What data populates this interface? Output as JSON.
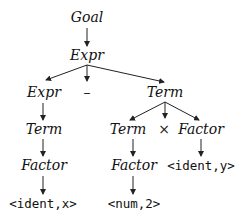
{
  "diagram": {
    "type": "parse-tree",
    "nodes": [
      {
        "id": "goal",
        "label": "Goal",
        "kind": "nonterminal",
        "x": 87,
        "y": 22
      },
      {
        "id": "expr1",
        "label": "Expr",
        "kind": "nonterminal",
        "x": 87,
        "y": 60
      },
      {
        "id": "expr2",
        "label": "Expr",
        "kind": "nonterminal",
        "x": 44,
        "y": 97
      },
      {
        "id": "minus",
        "label": "–",
        "kind": "operator",
        "x": 87,
        "y": 97
      },
      {
        "id": "term1",
        "label": "Term",
        "kind": "nonterminal",
        "x": 165,
        "y": 97
      },
      {
        "id": "term2",
        "label": "Term",
        "kind": "nonterminal",
        "x": 44,
        "y": 134
      },
      {
        "id": "term3",
        "label": "Term",
        "kind": "nonterminal",
        "x": 128,
        "y": 134
      },
      {
        "id": "times",
        "label": "×",
        "kind": "operator",
        "x": 164,
        "y": 134
      },
      {
        "id": "factor1",
        "label": "Factor",
        "kind": "nonterminal",
        "x": 201,
        "y": 134
      },
      {
        "id": "factor2",
        "label": "Factor",
        "kind": "nonterminal",
        "x": 44,
        "y": 170
      },
      {
        "id": "factor3",
        "label": "Factor",
        "kind": "nonterminal",
        "x": 134,
        "y": 170
      },
      {
        "id": "identy",
        "label": "<ident,y>",
        "kind": "terminal",
        "x": 201,
        "y": 170
      },
      {
        "id": "identx",
        "label": "<ident,x>",
        "kind": "terminal",
        "x": 43,
        "y": 208
      },
      {
        "id": "num2",
        "label": "<num,2>",
        "kind": "terminal",
        "x": 134,
        "y": 208
      }
    ],
    "edges": [
      {
        "from": "goal",
        "to": "expr1",
        "x1": 87,
        "y1": 28,
        "x2": 87,
        "y2": 46
      },
      {
        "from": "expr1",
        "to": "expr2",
        "x1": 87,
        "y1": 65,
        "x2": 46,
        "y2": 80
      },
      {
        "from": "expr1",
        "to": "minus",
        "x1": 87,
        "y1": 65,
        "x2": 87,
        "y2": 81
      },
      {
        "from": "expr1",
        "to": "term1",
        "x1": 87,
        "y1": 65,
        "x2": 164,
        "y2": 82
      },
      {
        "from": "expr2",
        "to": "term2",
        "x1": 43,
        "y1": 103,
        "x2": 43,
        "y2": 120
      },
      {
        "from": "term1",
        "to": "term3",
        "x1": 165,
        "y1": 102,
        "x2": 130,
        "y2": 120
      },
      {
        "from": "term1",
        "to": "times",
        "x1": 165,
        "y1": 102,
        "x2": 165,
        "y2": 118
      },
      {
        "from": "term1",
        "to": "factor1",
        "x1": 165,
        "y1": 102,
        "x2": 199,
        "y2": 120
      },
      {
        "from": "term2",
        "to": "factor2",
        "x1": 43,
        "y1": 139,
        "x2": 43,
        "y2": 156
      },
      {
        "from": "term3",
        "to": "factor3",
        "x1": 133,
        "y1": 139,
        "x2": 133,
        "y2": 156
      },
      {
        "from": "factor1",
        "to": "identy",
        "x1": 201,
        "y1": 139,
        "x2": 201,
        "y2": 156
      },
      {
        "from": "factor2",
        "to": "identx",
        "x1": 43,
        "y1": 176,
        "x2": 43,
        "y2": 194
      },
      {
        "from": "factor3",
        "to": "num2",
        "x1": 133,
        "y1": 176,
        "x2": 133,
        "y2": 194
      }
    ]
  }
}
